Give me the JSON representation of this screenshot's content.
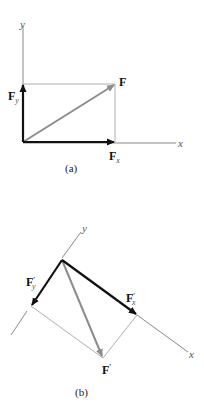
{
  "figure_a": {
    "caption": "(a)",
    "axis_x_label": "x",
    "axis_y_label": "y",
    "vectors": [
      {
        "name": "F",
        "label": "F",
        "subscript": "",
        "color": "#8c8c8c"
      },
      {
        "name": "Fx",
        "label": "F",
        "subscript": "x",
        "color": "#111111"
      },
      {
        "name": "Fy",
        "label": "F",
        "subscript": "y",
        "color": "#111111"
      }
    ]
  },
  "figure_b": {
    "caption": "(b)",
    "axis_x_label": "x",
    "axis_y_label": "y",
    "vectors": [
      {
        "name": "F'",
        "label": "F",
        "prime": "′",
        "subscript": "",
        "color": "#8c8c8c"
      },
      {
        "name": "Fx'",
        "label": "F",
        "prime": "′",
        "subscript": "x",
        "color": "#111111"
      },
      {
        "name": "Fy'",
        "label": "F",
        "prime": "′",
        "subscript": "y",
        "color": "#111111"
      }
    ]
  },
  "colors": {
    "component_vector": "#111111",
    "resultant_vector": "#8c8c8c",
    "axis_line": "#8a8a8a",
    "construction_line": "#b0b0b0"
  }
}
